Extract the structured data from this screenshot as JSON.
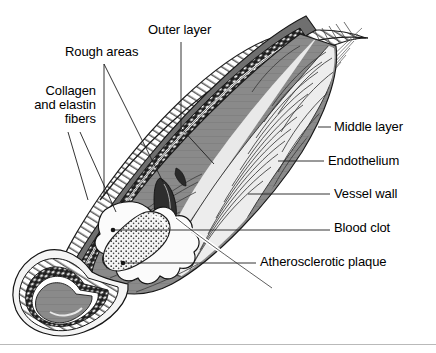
{
  "figure": {
    "type": "medical-illustration",
    "colors": {
      "line": "#1a1a1a",
      "lumen_gray": "#8a8a8a",
      "wall_dark": "#2b2b2b",
      "clot_fill": "#f2f2f2",
      "background": "#ffffff",
      "rule": "#b9b9b9"
    }
  },
  "labels": {
    "outer_layer": "Outer layer",
    "rough_areas": "Rough areas",
    "collagen_line1": "Collagen",
    "collagen_line2": "and elastin",
    "collagen_line3": "fibers",
    "middle_layer": "Middle layer",
    "endothelium": "Endothelium",
    "vessel_wall": "Vessel wall",
    "blood_clot": "Blood clot",
    "atherosclerotic_plaque": "Atherosclerotic plaque"
  }
}
